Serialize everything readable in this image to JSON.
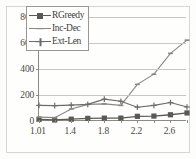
{
  "chart_data": {
    "type": "line",
    "title": "",
    "xlabel": "",
    "ylabel": "",
    "x": [
      1.01,
      1.2,
      1.4,
      1.6,
      1.8,
      2.0,
      2.2,
      2.4,
      2.6,
      2.8
    ],
    "xtick_labels": [
      "1.01",
      "1.4",
      "1.8",
      "2.2",
      "2.6"
    ],
    "xtick_values": [
      1.01,
      1.4,
      1.8,
      2.2,
      2.6
    ],
    "ytick_labels": [
      "0",
      "200",
      "400",
      "600",
      "800"
    ],
    "ytick_values": [
      0,
      200,
      400,
      600,
      800
    ],
    "ylim": [
      0,
      800
    ],
    "grid": true,
    "legend_position": "upper-left-inside",
    "series": [
      {
        "name": "RGreedy",
        "marker": "filled-square",
        "color": "#5b5854",
        "values": [
          12,
          8,
          14,
          20,
          22,
          22,
          36,
          38,
          48,
          62
        ]
      },
      {
        "name": "Inc-Dec",
        "marker": "small-dash",
        "color": "#8a8783",
        "values": [
          30,
          26,
          92,
          128,
          132,
          120,
          282,
          360,
          520,
          622
        ]
      },
      {
        "name": "Ext-Len",
        "marker": "cross",
        "color": "#6e6b67",
        "values": [
          120,
          118,
          122,
          128,
          168,
          152,
          106,
          120,
          142,
          108
        ]
      }
    ]
  },
  "legend": {
    "items": [
      {
        "label": "RGreedy",
        "marker": "filled-square"
      },
      {
        "label": "Inc-Dec",
        "marker": "small-dash"
      },
      {
        "label": "Ext-Len",
        "marker": "cross"
      }
    ]
  }
}
